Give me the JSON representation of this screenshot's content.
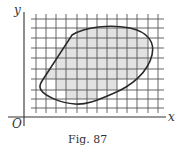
{
  "figure": {
    "caption": "Fig. 87",
    "axes": {
      "x_label": "x",
      "y_label": "y",
      "origin_label": "O"
    },
    "grid": {
      "vertical_lines_x": [
        36,
        46,
        56,
        66,
        77,
        87,
        97,
        107,
        117,
        127,
        137,
        148,
        158
      ],
      "horizontal_lines_y": [
        19,
        28,
        38,
        48,
        58,
        69,
        79,
        90,
        99,
        108
      ]
    },
    "region": {
      "description": "closed convex-like curve enclosing an area; grid squares wholly inside are shaded",
      "shade_color": "#e2e2e2",
      "curve_color": "#2a2a2a"
    },
    "colors": {
      "axis": "#333333",
      "grid": "#555555",
      "background": "#ffffff"
    }
  }
}
